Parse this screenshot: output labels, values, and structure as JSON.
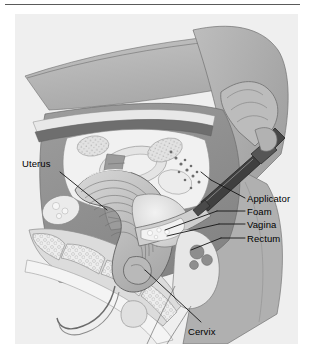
{
  "figure": {
    "type": "medical-illustration",
    "style": "grayscale line-and-tone anatomical drawing",
    "top_rule_color": "#5a5a5a",
    "panel_background": "#efefef",
    "label_color": "#000000",
    "leader_line_color": "#1a1a1a"
  },
  "labels": [
    {
      "id": "uterus",
      "text": "Uterus",
      "side": "left",
      "x": 7,
      "y": 144
    },
    {
      "id": "applicator",
      "text": "Applicator",
      "side": "right",
      "x": 232,
      "y": 179
    },
    {
      "id": "foam",
      "text": "Foam",
      "side": "right",
      "x": 232,
      "y": 192
    },
    {
      "id": "vagina",
      "text": "Vagina",
      "side": "right",
      "x": 232,
      "y": 205
    },
    {
      "id": "rectum",
      "text": "Rectum",
      "side": "right",
      "x": 232,
      "y": 219
    },
    {
      "id": "cervix",
      "text": "Cervix",
      "side": "bottom",
      "x": 173,
      "y": 312
    }
  ],
  "palette": {
    "torso_light": "#c9c9c9",
    "torso_mid": "#b4b4b4",
    "torso_dark": "#9a9a9a",
    "muscle_deep": "#8a8a8a",
    "organ_pale": "#e6e6e6",
    "organ_white": "#f4f4f4",
    "bone_fill": "#dedede",
    "applicator_dark": "#3c3c3c",
    "outline": "#4a4a4a"
  }
}
